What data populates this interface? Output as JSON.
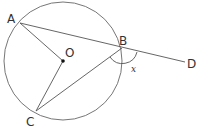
{
  "diagram": {
    "type": "circle-geometry",
    "circle": {
      "center_label": "O",
      "cx": 63,
      "cy": 61,
      "r": 59
    },
    "points": {
      "A": {
        "label": "A",
        "x": 20,
        "y": 23
      },
      "B": {
        "label": "B",
        "x": 122,
        "y": 48
      },
      "C": {
        "label": "C",
        "x": 36,
        "y": 111
      },
      "D": {
        "label": "D",
        "x": 185,
        "y": 62
      },
      "O": {
        "label": "O",
        "x": 63,
        "y": 61
      }
    },
    "segments": [
      "A-B-D",
      "A-O",
      "O-C",
      "C-B"
    ],
    "angle": {
      "vertex": "B",
      "between": [
        "C",
        "D"
      ],
      "label": "x"
    },
    "colors": {
      "stroke": "#555555",
      "text": "#333333"
    }
  }
}
